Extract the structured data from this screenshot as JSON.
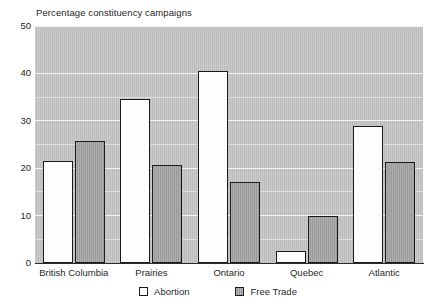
{
  "chart_data": {
    "type": "bar",
    "title": "Percentage constituency campaigns",
    "xlabel": "",
    "ylabel": "",
    "ylim": [
      0,
      50
    ],
    "yticks": [
      0,
      10,
      20,
      30,
      40,
      50
    ],
    "grid": true,
    "legend_position": "bottom-center",
    "categories": [
      "British Columbia",
      "Prairies",
      "Ontario",
      "Quebec",
      "Atlantic"
    ],
    "series": [
      {
        "name": "Abortion",
        "color": "#ffffff",
        "values": [
          21.5,
          34.6,
          40.5,
          2.6,
          29.0
        ]
      },
      {
        "name": "Free Trade",
        "color": "#a2a2a2",
        "values": [
          25.7,
          20.7,
          17.0,
          10.0,
          21.3
        ]
      }
    ]
  },
  "axis": {
    "y_tick_labels": [
      "50",
      "40",
      "30",
      "20",
      "10",
      "0"
    ]
  },
  "legend": {
    "items": [
      {
        "label": "Abortion",
        "swatch": "hollow-square-icon"
      },
      {
        "label": "Free Trade",
        "swatch": "filled-square-icon"
      }
    ]
  }
}
